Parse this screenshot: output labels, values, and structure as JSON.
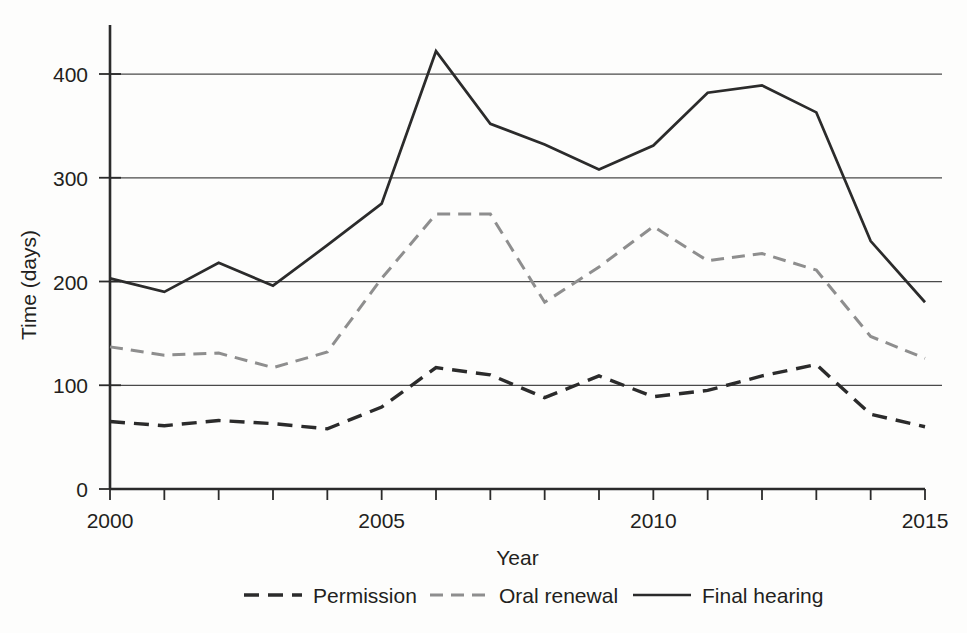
{
  "chart_data": {
    "type": "line",
    "title": "",
    "xlabel": "Year",
    "ylabel": "Time (days)",
    "xlim": [
      2000,
      2015
    ],
    "ylim": [
      0,
      440
    ],
    "grid": true,
    "legend_position": "bottom",
    "x": [
      2000,
      2001,
      2002,
      2003,
      2004,
      2005,
      2006,
      2007,
      2008,
      2009,
      2010,
      2011,
      2012,
      2013,
      2014,
      2015
    ],
    "xticks": [
      2000,
      2001,
      2002,
      2003,
      2004,
      2005,
      2006,
      2007,
      2008,
      2009,
      2010,
      2011,
      2012,
      2013,
      2014,
      2015
    ],
    "xtick_labels": [
      "2000",
      "",
      "",
      "",
      "",
      "2005",
      "",
      "",
      "",
      "",
      "2010",
      "",
      "",
      "",
      "",
      "2015"
    ],
    "yticks": [
      0,
      100,
      200,
      300,
      400
    ],
    "ytick_labels": [
      "0",
      "100",
      "200",
      "300",
      "400"
    ],
    "gridlines": [
      100,
      200,
      300,
      400
    ],
    "series": [
      {
        "name": "Permission",
        "style": "dashed",
        "color": "#2b2b2b",
        "values": [
          65,
          61,
          66,
          63,
          58,
          79,
          117,
          110,
          88,
          109,
          89,
          95,
          109,
          120,
          72,
          60
        ]
      },
      {
        "name": "Oral renewal",
        "style": "dashed",
        "color": "#8e8e8e",
        "values": [
          137,
          129,
          131,
          117,
          132,
          203,
          265,
          265,
          180,
          214,
          253,
          220,
          227,
          211,
          147,
          126
        ]
      },
      {
        "name": "Final hearing",
        "style": "solid",
        "color": "#2b2b2b",
        "values": [
          203,
          190,
          218,
          196,
          235,
          275,
          422,
          352,
          332,
          308,
          331,
          382,
          389,
          363,
          239,
          180
        ]
      }
    ]
  },
  "legend": {
    "items": [
      {
        "label": "Permission"
      },
      {
        "label": "Oral renewal"
      },
      {
        "label": "Final hearing"
      }
    ]
  },
  "axes": {
    "y_title": "Time (days)",
    "x_title": "Year"
  }
}
